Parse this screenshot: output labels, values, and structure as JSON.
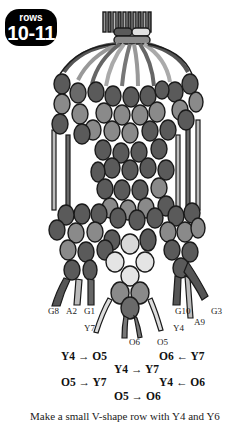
{
  "badge": {
    "small": "rows",
    "big": "10-11"
  },
  "strand_labels": {
    "g8": "G8",
    "a2": "A2",
    "g1": "G1",
    "y7": "Y7",
    "y4": "Y4",
    "o6": "O6",
    "o5": "O5",
    "g10": "G10",
    "a9": "A9",
    "g3": "G3"
  },
  "sequence": [
    {
      "from": "Y4",
      "arrow": "→",
      "to": "O5"
    },
    {
      "from": "O6",
      "arrow": "←",
      "to": "Y7"
    },
    {
      "from": "Y4",
      "arrow": "→",
      "to": "Y7"
    },
    {
      "from": "O5",
      "arrow": "→",
      "to": "Y7"
    },
    {
      "from": "Y4",
      "arrow": "←",
      "to": "O6"
    },
    {
      "from": "O5",
      "arrow": "→",
      "to": "O6"
    }
  ],
  "sequence_text": {
    "s0": "Y4 → O5",
    "s1": "O6 ← Y7",
    "s2": "Y4 → Y7",
    "s3": "O5 → Y7",
    "s4": "Y4 ← O6",
    "s5": "O5 → O6"
  },
  "caption": "Make a small V-shape row with Y4 and Y6",
  "colors": {
    "dark": "#5a5a5a",
    "mid": "#8a8a8a",
    "light": "#d8d8d8",
    "outline": "#1a1a1a",
    "badge": "#000000"
  }
}
